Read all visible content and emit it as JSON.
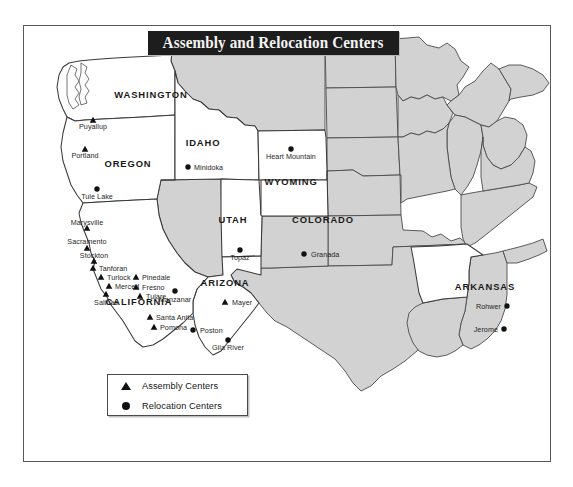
{
  "page": {
    "background_color": "#ffffff",
    "frame_color": "#58585a"
  },
  "title": {
    "text": "Assembly and Relocation Centers",
    "banner_color": "#1d1d1d",
    "text_color": "#f4f4f4"
  },
  "map": {
    "highlight_fill": "#ffffff",
    "other_state_fill": "#d2d2d2",
    "border_color": "#4b4b4b",
    "marker_color": "#111111",
    "highlighted_states": [
      "WASHINGTON",
      "OREGON",
      "IDAHO",
      "WYOMING",
      "UTAH",
      "COLORADO",
      "ARIZONA",
      "CALIFORNIA",
      "ARKANSAS"
    ],
    "state_labels": [
      {
        "name": "WASHINGTON",
        "x": 128,
        "y": 73
      },
      {
        "name": "OREGON",
        "x": 105,
        "y": 142
      },
      {
        "name": "IDAHO",
        "x": 180,
        "y": 121
      },
      {
        "name": "WYOMING",
        "x": 268,
        "y": 160
      },
      {
        "name": "UTAH",
        "x": 210,
        "y": 198
      },
      {
        "name": "COLORADO",
        "x": 300,
        "y": 198
      },
      {
        "name": "ARIZONA",
        "x": 202,
        "y": 261
      },
      {
        "name": "CALIFORNIA",
        "x": 116,
        "y": 280
      },
      {
        "name": "ARKANSAS",
        "x": 462,
        "y": 265
      }
    ],
    "markers": [
      {
        "name": "Puyallup",
        "type": "assembly",
        "mx": 70,
        "my": 95,
        "lx": 70,
        "ly": 104,
        "anchor": "middle"
      },
      {
        "name": "Portland",
        "type": "assembly",
        "mx": 62,
        "my": 124,
        "lx": 62,
        "ly": 133,
        "anchor": "middle"
      },
      {
        "name": "Minidoka",
        "type": "relocation",
        "mx": 165,
        "my": 142,
        "lx": 171,
        "ly": 145,
        "anchor": "start"
      },
      {
        "name": "Heart Mountain",
        "type": "relocation",
        "mx": 268,
        "my": 124,
        "lx": 268,
        "ly": 134,
        "anchor": "middle"
      },
      {
        "name": "Granada",
        "type": "relocation",
        "mx": 281,
        "my": 229,
        "lx": 288,
        "ly": 232,
        "anchor": "start"
      },
      {
        "name": "Topaz",
        "type": "relocation",
        "mx": 217,
        "my": 225,
        "lx": 217,
        "ly": 235,
        "anchor": "middle"
      },
      {
        "name": "Tule Lake",
        "type": "relocation",
        "mx": 74,
        "my": 164,
        "lx": 74,
        "ly": 174,
        "anchor": "middle"
      },
      {
        "name": "Marysville",
        "type": "assembly",
        "mx": 64,
        "my": 203,
        "lx": 64,
        "ly": 200,
        "anchor": "middle"
      },
      {
        "name": "Sacramento",
        "type": "assembly",
        "mx": 64,
        "my": 223,
        "lx": 64,
        "ly": 219,
        "anchor": "middle"
      },
      {
        "name": "Stockton",
        "type": "assembly",
        "mx": 71,
        "my": 236,
        "lx": 71,
        "ly": 233,
        "anchor": "middle"
      },
      {
        "name": "Tanforan",
        "type": "assembly",
        "mx": 70,
        "my": 243,
        "lx": 76,
        "ly": 246,
        "anchor": "start"
      },
      {
        "name": "Turlock",
        "type": "assembly",
        "mx": 78,
        "my": 252,
        "lx": 84,
        "ly": 255,
        "anchor": "start"
      },
      {
        "name": "Merced",
        "type": "assembly",
        "mx": 86,
        "my": 261,
        "lx": 92,
        "ly": 264,
        "anchor": "start"
      },
      {
        "name": "Salinas",
        "type": "assembly",
        "mx": 83,
        "my": 269,
        "lx": 83,
        "ly": 280,
        "anchor": "middle"
      },
      {
        "name": "Pinedale",
        "type": "assembly",
        "mx": 113,
        "my": 252,
        "lx": 119,
        "ly": 255,
        "anchor": "start"
      },
      {
        "name": "Fresno",
        "type": "assembly",
        "mx": 113,
        "my": 262,
        "lx": 119,
        "ly": 265,
        "anchor": "start"
      },
      {
        "name": "Tulare",
        "type": "assembly",
        "mx": 117,
        "my": 271,
        "lx": 123,
        "ly": 274,
        "anchor": "start"
      },
      {
        "name": "Manzanar",
        "type": "relocation",
        "mx": 152,
        "my": 266,
        "lx": 152,
        "ly": 277,
        "anchor": "middle"
      },
      {
        "name": "Santa Anita",
        "type": "assembly",
        "mx": 127,
        "my": 292,
        "lx": 133,
        "ly": 295,
        "anchor": "start"
      },
      {
        "name": "Pomona",
        "type": "assembly",
        "mx": 131,
        "my": 302,
        "lx": 137,
        "ly": 305,
        "anchor": "start"
      },
      {
        "name": "Mayer",
        "type": "assembly",
        "mx": 202,
        "my": 277,
        "lx": 209,
        "ly": 280,
        "anchor": "start"
      },
      {
        "name": "Poston",
        "type": "relocation",
        "mx": 170,
        "my": 305,
        "lx": 177,
        "ly": 308,
        "anchor": "start"
      },
      {
        "name": "Gila River",
        "type": "relocation",
        "mx": 205,
        "my": 315,
        "lx": 205,
        "ly": 325,
        "anchor": "middle"
      },
      {
        "name": "Rohwer",
        "type": "relocation",
        "mx": 484,
        "my": 281,
        "lx": 478,
        "ly": 284,
        "anchor": "end"
      },
      {
        "name": "Jerome",
        "type": "relocation",
        "mx": 481,
        "my": 304,
        "lx": 475,
        "ly": 307,
        "anchor": "end"
      }
    ]
  },
  "legend": {
    "items": [
      {
        "glyph": "triangle-marker",
        "label": "Assembly Centers"
      },
      {
        "glyph": "circle-marker",
        "label": "Relocation Centers"
      }
    ]
  }
}
